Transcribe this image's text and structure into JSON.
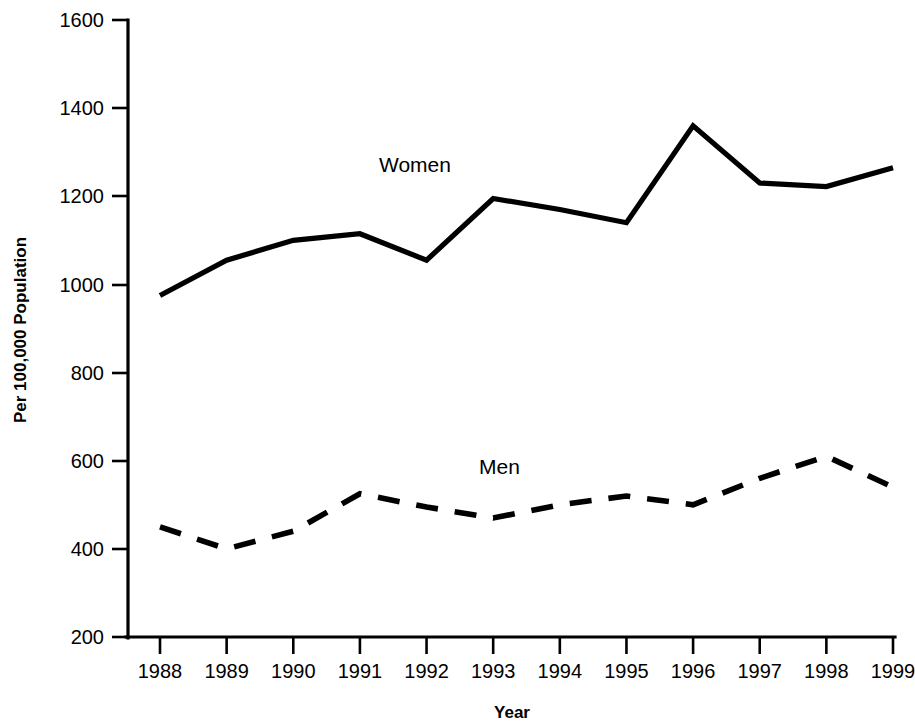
{
  "chart_data": {
    "type": "line",
    "title": "",
    "xlabel": "Year",
    "ylabel": "Per 100,000 Population",
    "categories": [
      "1988",
      "1989",
      "1990",
      "1991",
      "1992",
      "1993",
      "1994",
      "1995",
      "1996",
      "1997",
      "1998",
      "1999"
    ],
    "x": [
      1988,
      1989,
      1990,
      1991,
      1992,
      1993,
      1994,
      1995,
      1996,
      1997,
      1998,
      1999
    ],
    "xlim": [
      1988,
      1999
    ],
    "ylim": [
      200,
      1600
    ],
    "ytick_labels": [
      "1600",
      "1400",
      "1200",
      "1000",
      "800",
      "600",
      "400",
      "200"
    ],
    "yticks": [
      1600,
      1400,
      1200,
      1000,
      800,
      600,
      400,
      200
    ],
    "grid": "off",
    "legend_position": "inline-annotations",
    "series": [
      {
        "name": "Women",
        "style": "solid",
        "label_value": "Women",
        "values": [
          975,
          1055,
          1100,
          1115,
          1055,
          1195,
          1170,
          1140,
          1360,
          1230,
          1222,
          1265
        ]
      },
      {
        "name": "Men",
        "style": "dashed",
        "label_value": "Men",
        "values": [
          450,
          400,
          440,
          525,
          495,
          470,
          500,
          520,
          500,
          560,
          610,
          540
        ]
      }
    ]
  },
  "annotations": {
    "women_label": "Women",
    "men_label": "Men"
  },
  "colors": {
    "line": "#000000",
    "text": "#000000",
    "background": "#FFFFFF"
  }
}
